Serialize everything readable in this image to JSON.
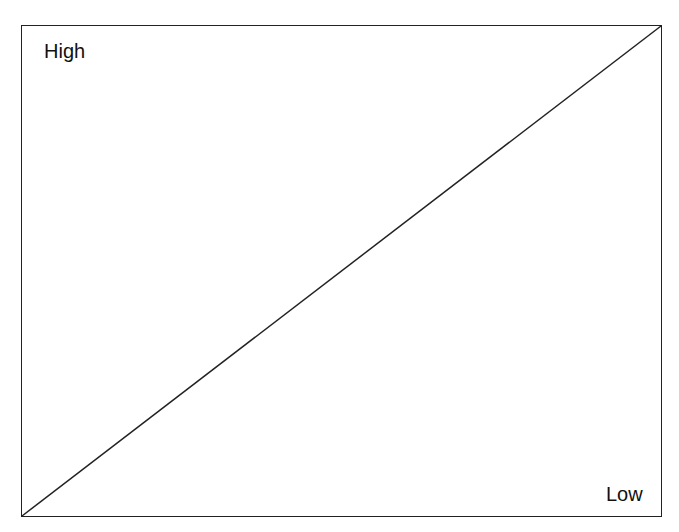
{
  "diagram": {
    "labels": {
      "top_left": "High",
      "bottom_right": "Low"
    },
    "diagonal": {
      "from": "bottom-left",
      "to": "top-right"
    },
    "colors": {
      "line": "#222222",
      "background": "#ffffff"
    }
  }
}
